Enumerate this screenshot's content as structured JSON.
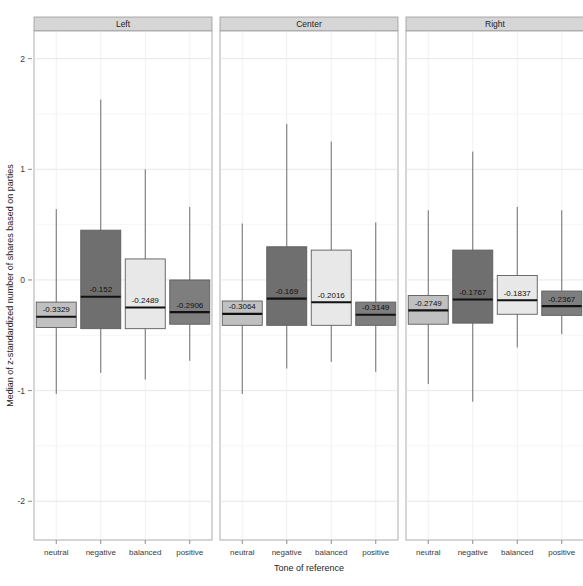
{
  "chart_data": {
    "type": "boxplot",
    "title": "",
    "xlabel": "Tone of reference",
    "ylabel": "Median of z-standardized number of shares based on parties",
    "ylim": [
      -2.35,
      2.25
    ],
    "yticks": [
      2,
      1,
      0,
      -1,
      -2
    ],
    "ytick_labels": [
      "2",
      "1",
      "0",
      "-1",
      "-2"
    ],
    "grid": true,
    "legend": "none",
    "facet_variable": "party_position",
    "categories": [
      "neutral",
      "negative",
      "balanced",
      "positive"
    ],
    "category_colors": [
      "#c0c0c0",
      "#6f6f6f",
      "#e8e8e8",
      "#7e7e7e"
    ],
    "panels": [
      {
        "label": "Left",
        "boxes": [
          {
            "category": "neutral",
            "median": -0.3329,
            "median_label": "-0.3329",
            "q1": -0.43,
            "q3": -0.2,
            "whisker_low": -1.03,
            "whisker_high": 0.64,
            "fill": "#c0c0c0"
          },
          {
            "category": "negative",
            "median": -0.152,
            "median_label": "-0.152",
            "q1": -0.44,
            "q3": 0.45,
            "whisker_low": -0.84,
            "whisker_high": 1.63,
            "fill": "#6f6f6f"
          },
          {
            "category": "balanced",
            "median": -0.2489,
            "median_label": "-0.2489",
            "q1": -0.44,
            "q3": 0.19,
            "whisker_low": -0.9,
            "whisker_high": 1.0,
            "fill": "#e8e8e8"
          },
          {
            "category": "positive",
            "median": -0.2906,
            "median_label": "-0.2906",
            "q1": -0.4,
            "q3": 0.0,
            "whisker_low": -0.73,
            "whisker_high": 0.66,
            "fill": "#7e7e7e"
          }
        ]
      },
      {
        "label": "Center",
        "boxes": [
          {
            "category": "neutral",
            "median": -0.3064,
            "median_label": "-0.3064",
            "q1": -0.41,
            "q3": -0.19,
            "whisker_low": -1.03,
            "whisker_high": 0.51,
            "fill": "#c0c0c0"
          },
          {
            "category": "negative",
            "median": -0.169,
            "median_label": "-0.169",
            "q1": -0.41,
            "q3": 0.3,
            "whisker_low": -0.8,
            "whisker_high": 1.41,
            "fill": "#6f6f6f"
          },
          {
            "category": "balanced",
            "median": -0.2016,
            "median_label": "-0.2016",
            "q1": -0.41,
            "q3": 0.27,
            "whisker_low": -0.74,
            "whisker_high": 1.25,
            "fill": "#e8e8e8"
          },
          {
            "category": "positive",
            "median": -0.3149,
            "median_label": "-0.3149",
            "q1": -0.41,
            "q3": -0.2,
            "whisker_low": -0.83,
            "whisker_high": 0.52,
            "fill": "#7e7e7e"
          }
        ]
      },
      {
        "label": "Right",
        "boxes": [
          {
            "category": "neutral",
            "median": -0.2749,
            "median_label": "-0.2749",
            "q1": -0.4,
            "q3": -0.14,
            "whisker_low": -0.94,
            "whisker_high": 0.63,
            "fill": "#c0c0c0"
          },
          {
            "category": "negative",
            "median": -0.1767,
            "median_label": "-0.1767",
            "q1": -0.39,
            "q3": 0.27,
            "whisker_low": -1.1,
            "whisker_high": 1.16,
            "fill": "#6f6f6f"
          },
          {
            "category": "balanced",
            "median": -0.1837,
            "median_label": "-0.1837",
            "q1": -0.31,
            "q3": 0.04,
            "whisker_low": -0.61,
            "whisker_high": 0.66,
            "fill": "#e8e8e8"
          },
          {
            "category": "positive",
            "median": -0.2367,
            "median_label": "-0.2367",
            "q1": -0.32,
            "q3": -0.1,
            "whisker_low": -0.49,
            "whisker_high": 0.63,
            "fill": "#7e7e7e"
          }
        ]
      }
    ]
  }
}
